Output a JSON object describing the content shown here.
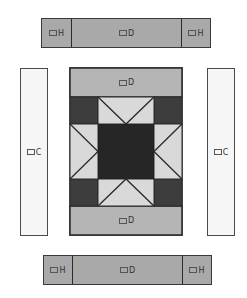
{
  "diagram": {
    "colors": {
      "strip_fill": "#a9a9a9",
      "band_fill": "#b5b5b5",
      "side_fill": "#f6f6f6",
      "corner_fill": "#3d3d3d",
      "center_fill": "#262626",
      "geese_fill": "#d9d9d9",
      "outline": "#2a2a2a"
    },
    "top_strip": {
      "left": {
        "piece": "H"
      },
      "middle": {
        "piece": "D"
      },
      "right": {
        "piece": "H"
      }
    },
    "side_strips": {
      "left": {
        "piece": "C"
      },
      "right": {
        "piece": "C"
      }
    },
    "center_block": {
      "top_band": {
        "piece": "D"
      },
      "bottom_band": {
        "piece": "D"
      },
      "star": {
        "corners": "dark squares",
        "center": "dark square",
        "points": "flying geese units (4)"
      }
    },
    "bottom_strip": {
      "left": {
        "piece": "H"
      },
      "middle": {
        "piece": "D"
      },
      "right": {
        "piece": "H"
      }
    }
  }
}
